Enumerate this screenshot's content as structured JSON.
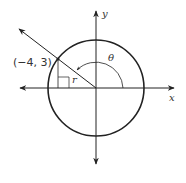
{
  "diagram": {
    "point_label": "(−4, 3)",
    "point": {
      "x": -4,
      "y": 3
    },
    "angle_label": "θ",
    "radius_label": "r",
    "x_axis_label": "x",
    "y_axis_label": "y",
    "colors": {
      "line": "#222222",
      "text": "#333333",
      "background": "#ffffff"
    }
  }
}
